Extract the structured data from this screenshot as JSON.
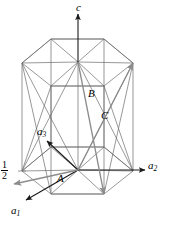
{
  "figure": {
    "name": "hexagonal-unit-cell-diagram",
    "type": "crystallographic-axes-diagram",
    "background_color": "#ffffff",
    "line_color": "#555555",
    "accent_line_color": "#808080",
    "text_color": "#000000"
  },
  "axes": [
    {
      "id": "c",
      "label": "c",
      "sub": "",
      "x": 76,
      "y": 2,
      "desc": "vertical c axis arrow pointing up"
    },
    {
      "id": "a2",
      "label": "a",
      "sub": "2",
      "x": 148,
      "y": 160,
      "desc": "horizontal a2 axis arrow pointing right"
    },
    {
      "id": "a3",
      "label": "a",
      "sub": "3",
      "x": 37,
      "y": 126,
      "desc": "a3 axis arrow pointing upper-left"
    },
    {
      "id": "a1",
      "label": "a",
      "sub": "1",
      "x": 11,
      "y": 205,
      "desc": "a1 axis arrow pointing lower-left"
    }
  ],
  "vectors": [
    {
      "id": "A",
      "label": "A",
      "x": 57,
      "y": 173,
      "desc": "gray arrow A pointing left from origin"
    },
    {
      "id": "B",
      "label": "B",
      "x": 88,
      "y": 88,
      "desc": "gray arrow B from top center down to bottom front"
    },
    {
      "id": "C",
      "label": "C",
      "x": 101,
      "y": 110,
      "desc": "gray arrow C from bottom up to top right corner"
    }
  ],
  "annotations": [
    {
      "id": "half-fraction",
      "numerator": "1",
      "denominator": "2",
      "x": 1,
      "y": 160,
      "desc": "one half height marker on left edge"
    }
  ],
  "geometry": {
    "top_hexagon": {
      "center": [
        78,
        62
      ],
      "left": [
        22,
        63
      ],
      "right": [
        133,
        63
      ],
      "back_left": [
        51,
        39
      ],
      "back_right": [
        104,
        39
      ],
      "front_left": [
        51,
        86
      ],
      "front_right": [
        104,
        86
      ]
    },
    "bottom_hexagon": {
      "center": [
        78,
        170
      ],
      "left": [
        22,
        171
      ],
      "right": [
        133,
        171
      ],
      "back_left": [
        51,
        147
      ],
      "back_right": [
        104,
        147
      ],
      "front_left": [
        51,
        194
      ],
      "front_right": [
        104,
        194
      ]
    }
  }
}
